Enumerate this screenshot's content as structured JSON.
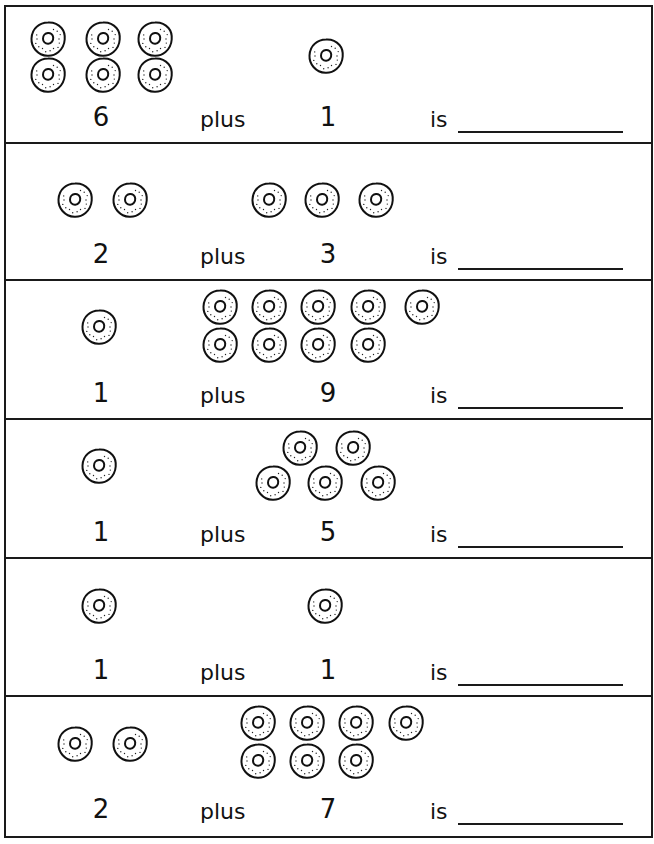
{
  "worksheet": {
    "problems": [
      {
        "a": "6",
        "plus": "plus",
        "b": "1",
        "is": "is",
        "answer": "",
        "a_rings": [
          [
            23,
            13
          ],
          [
            78,
            13
          ],
          [
            130,
            13
          ],
          [
            23,
            49
          ],
          [
            78,
            49
          ],
          [
            130,
            49
          ]
        ],
        "b_rings": [
          [
            301,
            30
          ]
        ]
      },
      {
        "a": "2",
        "plus": "plus",
        "b": "3",
        "is": "is",
        "answer": "",
        "a_rings": [
          [
            50,
            37
          ],
          [
            105,
            37
          ]
        ],
        "b_rings": [
          [
            244,
            37
          ],
          [
            297,
            37
          ],
          [
            351,
            37
          ]
        ]
      },
      {
        "a": "1",
        "plus": "plus",
        "b": "9",
        "is": "is",
        "answer": "",
        "a_rings": [
          [
            74,
            25
          ]
        ],
        "b_rings": [
          [
            195,
            5
          ],
          [
            244,
            5
          ],
          [
            293,
            5
          ],
          [
            343,
            5
          ],
          [
            397,
            5
          ],
          [
            195,
            43
          ],
          [
            244,
            43
          ],
          [
            293,
            43
          ],
          [
            343,
            43
          ]
        ]
      },
      {
        "a": "1",
        "plus": "plus",
        "b": "5",
        "is": "is",
        "answer": "",
        "a_rings": [
          [
            74,
            25
          ]
        ],
        "b_rings": [
          [
            275,
            7
          ],
          [
            328,
            7
          ],
          [
            248,
            42
          ],
          [
            300,
            42
          ],
          [
            353,
            42
          ]
        ]
      },
      {
        "a": "1",
        "plus": "plus",
        "b": "1",
        "is": "is",
        "answer": "",
        "a_rings": [
          [
            74,
            27
          ]
        ],
        "b_rings": [
          [
            300,
            27
          ]
        ]
      },
      {
        "a": "2",
        "plus": "plus",
        "b": "7",
        "is": "is",
        "answer": "",
        "a_rings": [
          [
            50,
            26
          ]
        ],
        "b_rings": []
      }
    ]
  }
}
